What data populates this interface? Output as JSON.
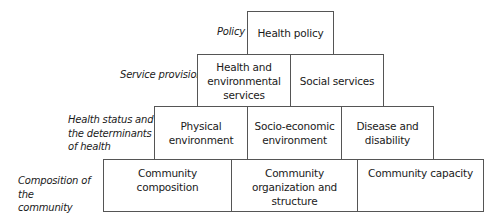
{
  "diagram": {
    "type": "stepped-pyramid",
    "levels": [
      {
        "label": "Policy",
        "boxes": [
          {
            "text": "Health policy"
          }
        ]
      },
      {
        "label": "Service provision",
        "boxes": [
          {
            "text": "Health and\nenvironmental\nservices"
          },
          {
            "text": "Social services"
          }
        ]
      },
      {
        "label": "Health status and\nthe determinants\nof health",
        "boxes": [
          {
            "text": "Physical\nenvironment"
          },
          {
            "text": "Socio-economic\nenvironment"
          },
          {
            "text": "Disease and\ndisability"
          }
        ]
      },
      {
        "label": "Composition of the\ncommunity",
        "boxes": [
          {
            "text": "Community\ncomposition"
          },
          {
            "text": "Community\norganization and\nstructure"
          },
          {
            "text": "Community capacity"
          }
        ]
      }
    ],
    "colors": {
      "border": "#555555",
      "text": "#1a1a1a",
      "background": "#ffffff"
    }
  }
}
